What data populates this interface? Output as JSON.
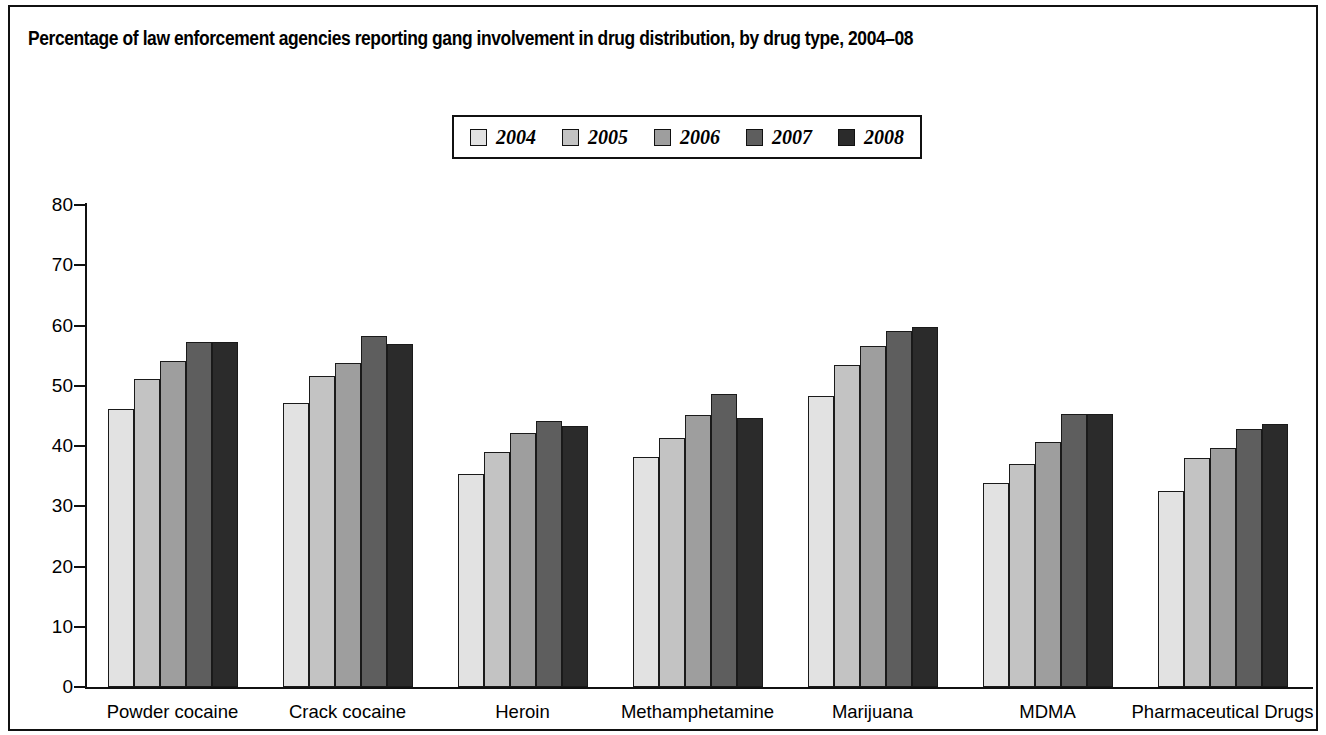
{
  "figure": {
    "title": "Percentage of law enforcement agencies reporting gang involvement in drug distribution, by drug type, 2004–08",
    "frame_color": "#111111",
    "background": "#ffffff"
  },
  "legend": {
    "position": "top-center",
    "entries": [
      {
        "label": "2004",
        "color": "#e2e2e2"
      },
      {
        "label": "2005",
        "color": "#c3c3c3"
      },
      {
        "label": "2006",
        "color": "#9e9e9e"
      },
      {
        "label": "2007",
        "color": "#5e5e5e"
      },
      {
        "label": "2008",
        "color": "#2b2b2b"
      }
    ]
  },
  "chart_data": {
    "type": "bar",
    "title": "Percentage of law enforcement agencies reporting gang involvement in drug distribution, by drug type, 2004–08",
    "xlabel": "",
    "ylabel": "",
    "ylim": [
      0,
      80
    ],
    "yticks": [
      "0",
      "10",
      "20",
      "30",
      "40",
      "50",
      "60",
      "70",
      "80"
    ],
    "grid": false,
    "legend_position": "top-center",
    "categories": [
      "Powder cocaine",
      "Crack cocaine",
      "Heroin",
      "Methamphetamine",
      "Marijuana",
      "MDMA",
      "Pharmaceutical Drugs"
    ],
    "series": [
      {
        "name": "2004",
        "color": "#e2e2e2",
        "values": [
          46.2,
          47.1,
          35.3,
          38.1,
          48.3,
          33.8,
          32.5
        ]
      },
      {
        "name": "2005",
        "color": "#c3c3c3",
        "values": [
          51.2,
          51.6,
          39.0,
          41.3,
          53.5,
          37.0,
          38.0
        ]
      },
      {
        "name": "2006",
        "color": "#9e9e9e",
        "values": [
          54.1,
          53.8,
          42.1,
          45.1,
          56.6,
          40.7,
          39.6
        ]
      },
      {
        "name": "2007",
        "color": "#5e5e5e",
        "values": [
          57.3,
          58.3,
          44.1,
          48.6,
          59.1,
          45.3,
          42.9
        ]
      },
      {
        "name": "2008",
        "color": "#2b2b2b",
        "values": [
          57.3,
          57.0,
          43.3,
          44.7,
          59.8,
          45.3,
          43.6
        ]
      }
    ]
  }
}
